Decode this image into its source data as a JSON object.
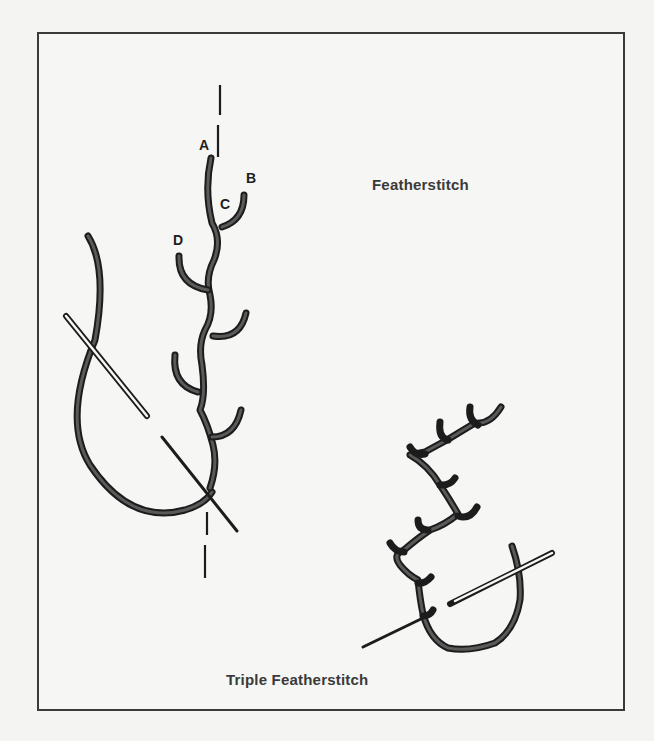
{
  "figure": {
    "titles": {
      "featherstitch": "Featherstitch",
      "triple_featherstitch": "Triple Featherstitch"
    },
    "point_labels": [
      "A",
      "B",
      "C",
      "D"
    ],
    "colors": {
      "thread": "#2b2b2b",
      "thread_fill": "#555555",
      "frame": "#3a3a3a",
      "background": "#f4f4f2",
      "text": "#333333"
    }
  }
}
